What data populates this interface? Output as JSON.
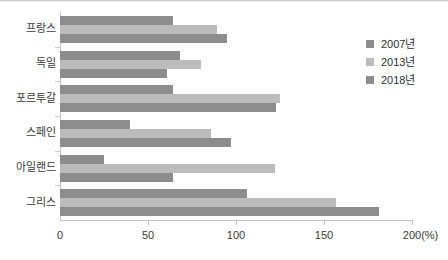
{
  "chart_data": {
    "type": "bar",
    "orientation": "horizontal",
    "title": "",
    "xlabel": "200(%)",
    "ylabel": "",
    "categories": [
      "프랑스",
      "독일",
      "포르투갈",
      "스페인",
      "아일랜드",
      "그리스"
    ],
    "series": [
      {
        "name": "2007년",
        "color": "#8d8d8d",
        "values": [
          64,
          68,
          64,
          40,
          25,
          106
        ]
      },
      {
        "name": "2013년",
        "color": "#bcbcbc",
        "values": [
          89,
          80,
          125,
          86,
          122,
          157
        ]
      },
      {
        "name": "2018년",
        "color": "#8d8d8d",
        "values": [
          95,
          61,
          123,
          97,
          64,
          181
        ]
      }
    ],
    "xlim": [
      0,
      200
    ],
    "xticks": [
      0,
      50,
      100,
      150,
      200
    ],
    "xtick_labels": [
      "0",
      "50",
      "100",
      "150",
      "200(%)"
    ],
    "grid": false,
    "legend_position": "right"
  },
  "legend": {
    "items": [
      {
        "label": "2007년",
        "color": "#8d8d8d"
      },
      {
        "label": "2013년",
        "color": "#bcbcbc"
      },
      {
        "label": "2018년",
        "color": "#8d8d8d"
      }
    ]
  },
  "axis": {
    "unit_suffix": "(%)"
  }
}
